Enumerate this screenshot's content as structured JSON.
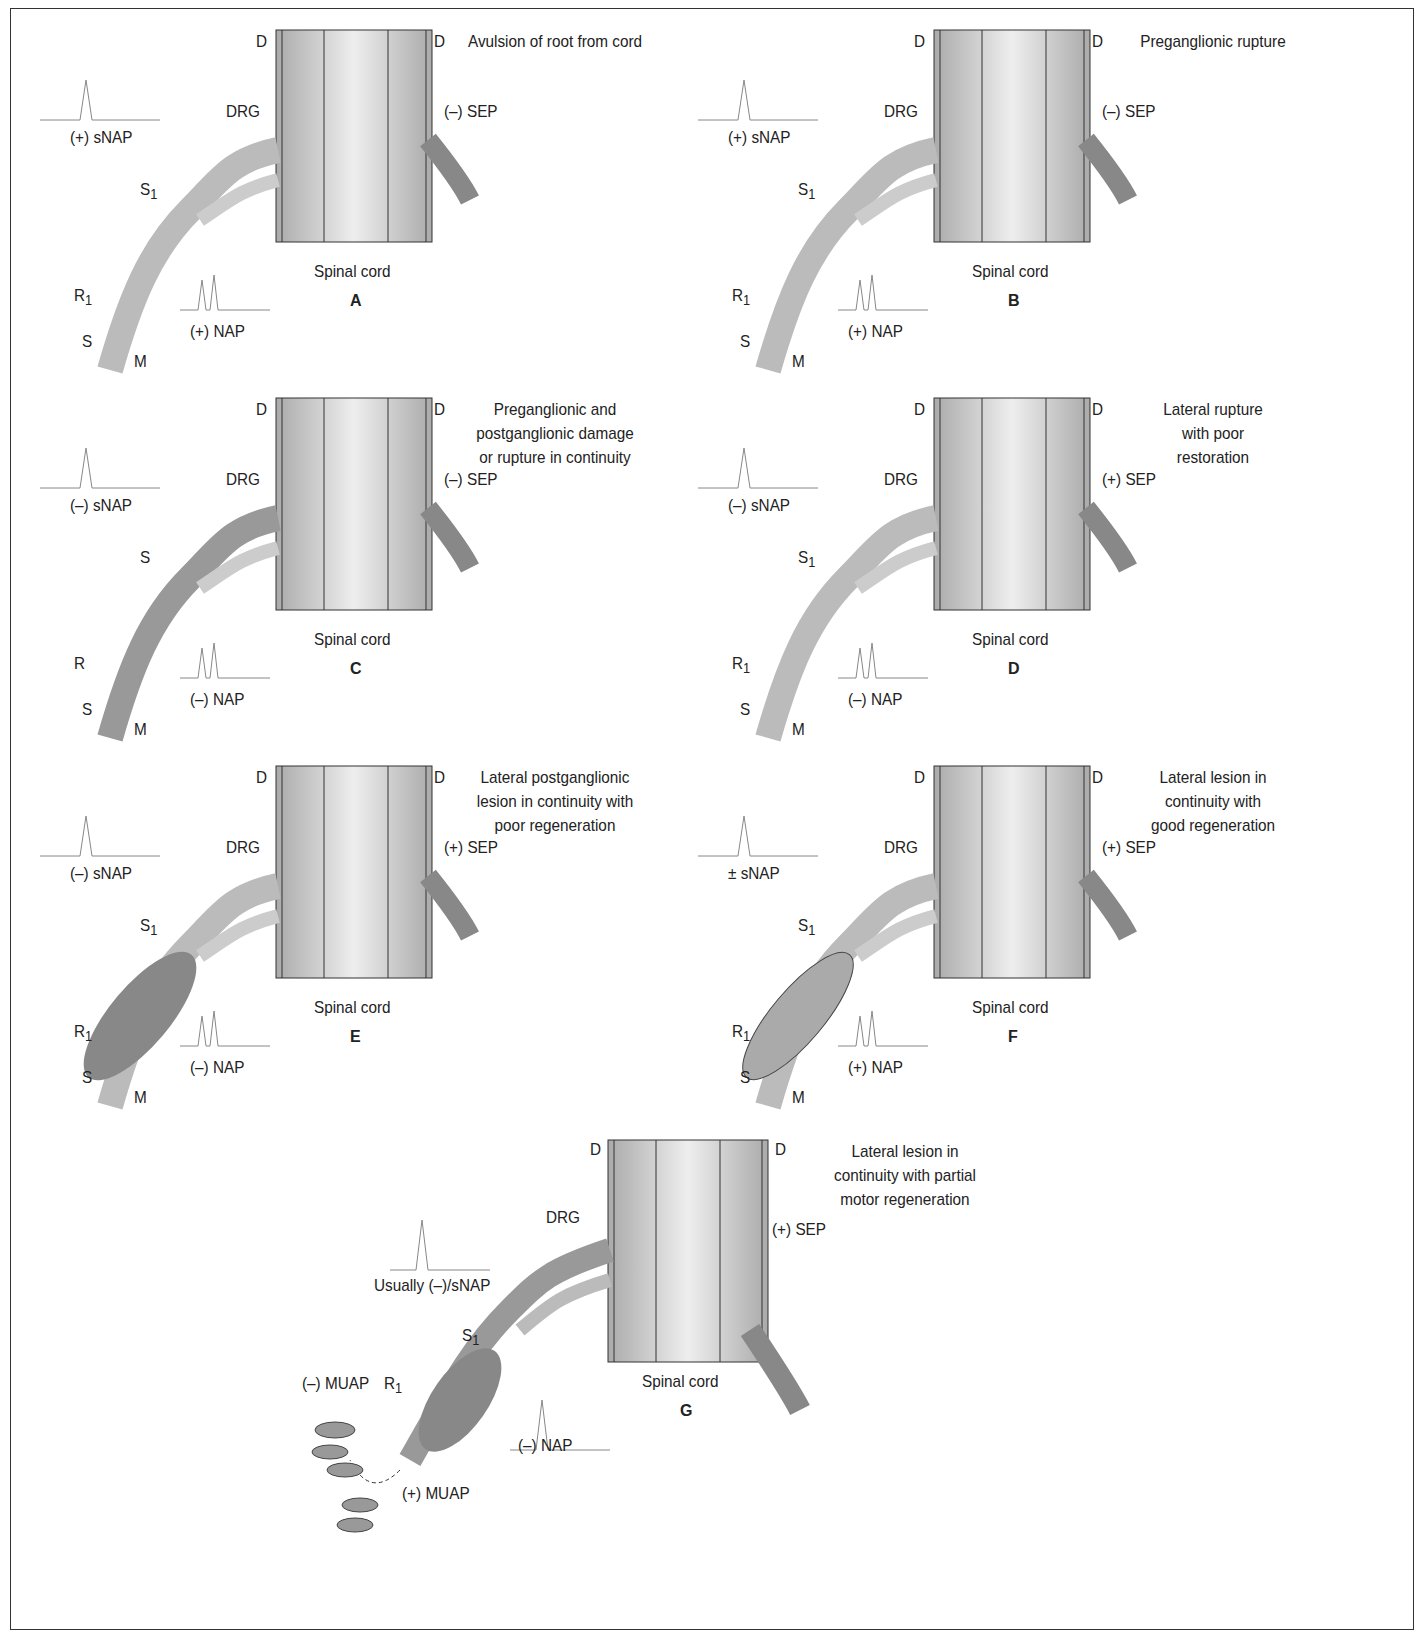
{
  "figure": {
    "panels": [
      {
        "id": "A",
        "title": "Avulsion of root from cord",
        "sensory_label": "(+) sNAP",
        "nerve_label": "(+) NAP",
        "sep_label": "(–) SEP",
        "drg": "DRG",
        "cord": "Spinal cord",
        "d": "D",
        "s_top": "S",
        "s_sub": "1",
        "r": "R",
        "r_sub": "1",
        "s": "S",
        "m": "M",
        "state": "avulsion"
      },
      {
        "id": "B",
        "title": "Preganglionic rupture",
        "sensory_label": "(+) sNAP",
        "nerve_label": "(+) NAP",
        "sep_label": "(–) SEP",
        "drg": "DRG",
        "cord": "Spinal cord",
        "d": "D",
        "s_top": "S",
        "s_sub": "1",
        "r": "R",
        "r_sub": "1",
        "s": "S",
        "m": "M",
        "state": "pre"
      },
      {
        "id": "C",
        "title": "Preganglionic and\npostganglionic damage\nor rupture in continuity",
        "sensory_label": "(–) sNAP",
        "nerve_label": "(–) NAP",
        "sep_label": "(–) SEP",
        "drg": "DRG",
        "cord": "Spinal cord",
        "d": "D",
        "s_top": "S",
        "s_sub": "",
        "r": "R",
        "r_sub": "",
        "s": "S",
        "m": "M",
        "state": "both"
      },
      {
        "id": "D",
        "title": "Lateral rupture\nwith poor\nrestoration",
        "sensory_label": "(–) sNAP",
        "nerve_label": "(–) NAP",
        "sep_label": "(+) SEP",
        "drg": "DRG",
        "cord": "Spinal cord",
        "d": "D",
        "s_top": "S",
        "s_sub": "1",
        "r": "R",
        "r_sub": "1",
        "s": "S",
        "m": "M",
        "state": "lateral"
      },
      {
        "id": "E",
        "title": "Lateral postganglionic\nlesion in continuity with\npoor regeneration",
        "sensory_label": "(–) sNAP",
        "nerve_label": "(–) NAP",
        "sep_label": "(+) SEP",
        "drg": "DRG",
        "cord": "Spinal cord",
        "d": "D",
        "s_top": "S",
        "s_sub": "1",
        "r": "R",
        "r_sub": "1",
        "s": "S",
        "m": "M",
        "state": "neuroma"
      },
      {
        "id": "F",
        "title": "Lateral lesion in\ncontinuity with\ngood regeneration",
        "sensory_label": "± sNAP",
        "nerve_label": "(+) NAP",
        "sep_label": "(+) SEP",
        "drg": "DRG",
        "cord": "Spinal cord",
        "d": "D",
        "s_top": "S",
        "s_sub": "1",
        "r": "R",
        "r_sub": "1",
        "s": "S",
        "m": "M",
        "state": "good"
      }
    ],
    "panel_g": {
      "id": "G",
      "title": "Lateral lesion in\ncontinuity with partial\nmotor regeneration",
      "sensory_label": "Usually (–)/sNAP",
      "nerve_label": "(–) NAP",
      "sep_label": "(+) SEP",
      "drg": "DRG",
      "cord": "Spinal cord",
      "d": "D",
      "s_top": "S",
      "s_sub": "1",
      "r": "R",
      "r_sub": "1",
      "muap_neg": "(–) MUAP",
      "muap_pos": "(+) MUAP"
    }
  }
}
